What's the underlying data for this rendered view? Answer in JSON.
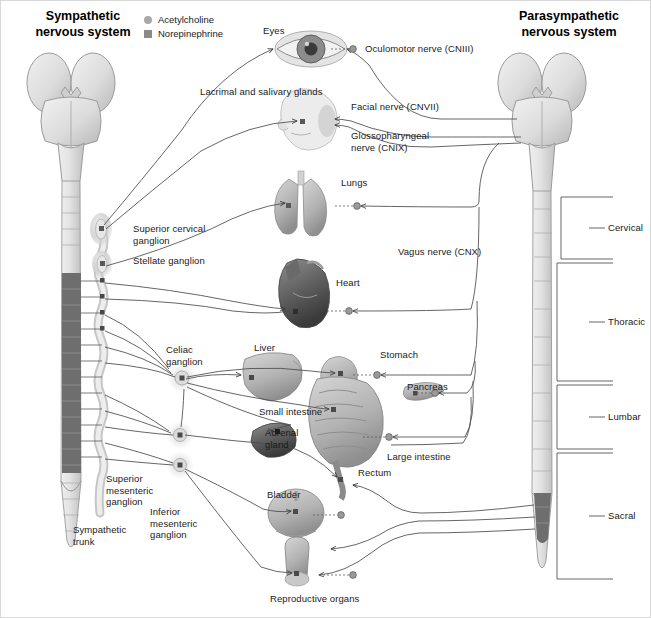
{
  "titles": {
    "left": "Sympathetic\nnervous system",
    "right": "Parasympathetic\nnervous system"
  },
  "legend": {
    "items": [
      {
        "label": "Acetylcholine",
        "marker": "circle",
        "color": "#a8a8a8"
      },
      {
        "label": "Norepinephrine",
        "marker": "square",
        "color": "#8a8a8a"
      }
    ]
  },
  "organs": [
    {
      "name": "eyes",
      "label": "Eyes"
    },
    {
      "name": "lacrimal-salivary-glands",
      "label": "Lacrimal and salivary glands"
    },
    {
      "name": "lungs",
      "label": "Lungs"
    },
    {
      "name": "heart",
      "label": "Heart"
    },
    {
      "name": "liver",
      "label": "Liver"
    },
    {
      "name": "stomach",
      "label": "Stomach"
    },
    {
      "name": "pancreas",
      "label": "Pancreas"
    },
    {
      "name": "small-intestine",
      "label": "Small intestine"
    },
    {
      "name": "large-intestine",
      "label": "Large intestine"
    },
    {
      "name": "adrenal-gland",
      "label": "Adrenal\ngland"
    },
    {
      "name": "rectum",
      "label": "Rectum"
    },
    {
      "name": "bladder",
      "label": "Bladder"
    },
    {
      "name": "reproductive-organs",
      "label": "Reproductive organs"
    }
  ],
  "nerves": [
    {
      "name": "oculomotor-nerve",
      "label": "Oculomotor nerve (CNIII)"
    },
    {
      "name": "facial-nerve",
      "label": "Facial nerve (CNVII)"
    },
    {
      "name": "glossopharyngeal-nerve",
      "label": "Glossopharyngeal\nnerve (CNIX)"
    },
    {
      "name": "vagus-nerve",
      "label": "Vagus nerve (CNX)"
    }
  ],
  "ganglia": [
    {
      "name": "superior-cervical-ganglion",
      "label": "Superior cervical\nganglion"
    },
    {
      "name": "stellate-ganglion",
      "label": "Stellate ganglion"
    },
    {
      "name": "celiac-ganglion",
      "label": "Celiac\nganglion"
    },
    {
      "name": "superior-mesenteric-ganglion",
      "label": "Superior\nmesenteric\nganglion"
    },
    {
      "name": "inferior-mesenteric-ganglion",
      "label": "Inferior\nmesenteric\nganglion"
    },
    {
      "name": "sympathetic-trunk",
      "label": "Sympathetic\ntrunk"
    }
  ],
  "spinal_regions": [
    {
      "name": "cervical",
      "label": "Cervical"
    },
    {
      "name": "thoracic",
      "label": "Thoracic"
    },
    {
      "name": "lumbar",
      "label": "Lumbar"
    },
    {
      "name": "sacral",
      "label": "Sacral"
    }
  ],
  "colors": {
    "line": "#4a4a4a",
    "text": "#1a1a1a",
    "brain_fill": "#dcdcdc",
    "brain_stroke": "#9a9a9a",
    "cord_dark": "#6e6e6e",
    "organ_gray": "#b4b4b4",
    "bracket": "#555555"
  }
}
